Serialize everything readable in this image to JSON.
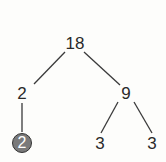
{
  "diagram": {
    "type": "factor-tree",
    "nodes": [
      {
        "id": "root",
        "label": "18",
        "x": 75,
        "y": 43,
        "highlighted": false
      },
      {
        "id": "left",
        "label": "2",
        "x": 22,
        "y": 93,
        "highlighted": false
      },
      {
        "id": "right",
        "label": "9",
        "x": 126,
        "y": 93,
        "highlighted": false
      },
      {
        "id": "left-child",
        "label": "2",
        "x": 22,
        "y": 143,
        "highlighted": true
      },
      {
        "id": "right-left",
        "label": "3",
        "x": 100,
        "y": 143,
        "highlighted": false
      },
      {
        "id": "right-right",
        "label": "3",
        "x": 152,
        "y": 143,
        "highlighted": false
      }
    ],
    "edges": [
      {
        "from": "root",
        "to": "left"
      },
      {
        "from": "root",
        "to": "right"
      },
      {
        "from": "left",
        "to": "left-child"
      },
      {
        "from": "right",
        "to": "right-left"
      },
      {
        "from": "right",
        "to": "right-right"
      }
    ],
    "colors": {
      "line": "#3a3a3a",
      "text": "#2a2a2a",
      "highlight_fill": "#7a7a7a",
      "highlight_text": "#ffffff"
    }
  }
}
